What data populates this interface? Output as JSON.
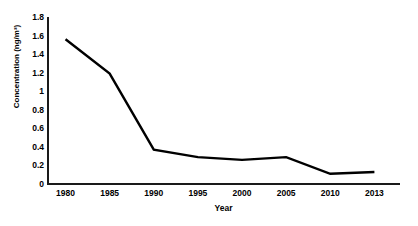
{
  "chart_data": {
    "type": "line",
    "title": "",
    "xlabel": "Year",
    "ylabel": "Concentration (ng/m³)",
    "categories": [
      "1980",
      "1985",
      "1990",
      "1995",
      "2000",
      "2005",
      "2010",
      "2013"
    ],
    "x": [
      1980,
      1985,
      1990,
      1995,
      2000,
      2005,
      2010,
      2013
    ],
    "values": [
      1.56,
      1.19,
      0.37,
      0.29,
      0.26,
      0.29,
      0.11,
      0.13
    ],
    "series": [
      {
        "name": "Concentration",
        "values": [
          1.56,
          1.19,
          0.37,
          0.29,
          0.26,
          0.29,
          0.11,
          0.13
        ],
        "color": "#000000",
        "line_width": 2.4
      }
    ],
    "ylim": [
      0,
      1.8
    ],
    "ytick_values": [
      0,
      0.2,
      0.4,
      0.6,
      0.8,
      1,
      1.2,
      1.4,
      1.6,
      1.8
    ],
    "ytick_labels": [
      "0",
      "0.2",
      "0.4",
      "0.6",
      "0.8",
      "1",
      "1.2",
      "1.4",
      "1.6",
      "1.8"
    ],
    "grid": false,
    "legend": false,
    "markers": false,
    "axis_color": "#1a1a1a",
    "background": "#ffffff"
  }
}
